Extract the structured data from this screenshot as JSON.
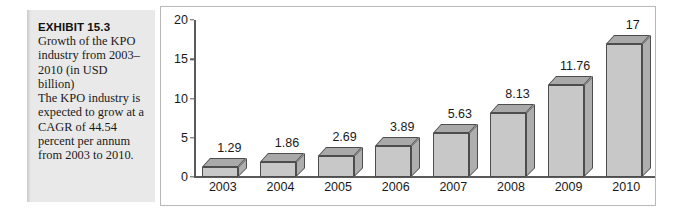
{
  "exhibit": {
    "title": "EXHIBIT 15.3",
    "description_line1": "Growth of the KPO industry from 2003–2010 (in USD billion)",
    "description_line2": "The KPO industry is expected to grow at a CAGR of 44.54 percent per annum from 2003 to 2010."
  },
  "chart_data": {
    "type": "bar",
    "title": "Growth of the KPO industry from 2003–2010 (in USD billion)",
    "xlabel": "",
    "ylabel": "",
    "categories": [
      "2003",
      "2004",
      "2005",
      "2006",
      "2007",
      "2008",
      "2009",
      "2010"
    ],
    "values": [
      1.29,
      1.86,
      2.69,
      3.89,
      5.63,
      8.13,
      11.76,
      17
    ],
    "value_labels": [
      "1.29",
      "1.86",
      "2.69",
      "3.89",
      "5.63",
      "8.13",
      "11.76",
      "17"
    ],
    "ylim": [
      0,
      20
    ],
    "yticks": [
      0,
      5,
      10,
      15,
      20
    ],
    "ytick_labels": [
      "0",
      "5",
      "10",
      "15",
      "20"
    ],
    "grid": false,
    "legend": false,
    "style": "3d-bar",
    "bar_face_color": "#c8c8c8",
    "bar_top_color": "#a9a9a9",
    "bar_side_color": "#aeaeae",
    "bar_edge_color": "#4d4d4d",
    "axis_color": "#5a5a5a",
    "panel_background": "#ffffff",
    "caption_background": "#e9e9e9"
  }
}
